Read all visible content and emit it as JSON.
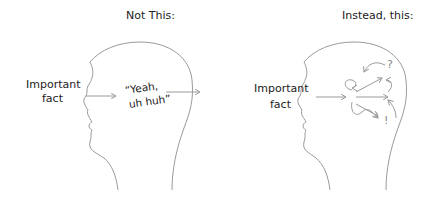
{
  "left_panel": {
    "title": "Not This:",
    "input_label_line1": "Important",
    "input_label_line2": "fact",
    "thought_line1": "“Yeah,",
    "thought_line2": "uh huh”"
  },
  "right_panel": {
    "title": "Instead, this:",
    "input_label_line1": "Important",
    "input_label_line2": "fact",
    "marks": [
      "?",
      "!"
    ]
  },
  "colors": {
    "stroke": "#9a9a9a",
    "text": "#222222"
  }
}
